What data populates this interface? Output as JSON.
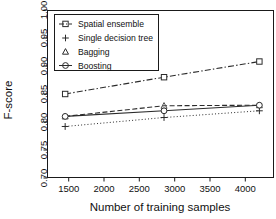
{
  "chart_data": {
    "type": "line",
    "title": "",
    "xlabel": "Number of training samples",
    "ylabel": "F-score",
    "xlim": [
      1200,
      4400
    ],
    "ylim": [
      0.7,
      1.0
    ],
    "xticks": [
      1500,
      2000,
      2500,
      3000,
      3500,
      4000
    ],
    "xtick_labels": [
      "1500",
      "2000",
      "2500",
      "3000",
      "3500",
      "4000"
    ],
    "yticks": [
      0.7,
      0.75,
      0.8,
      0.85,
      0.9,
      0.95,
      1.0
    ],
    "ytick_labels": [
      "0.70",
      "0.75",
      "0.80",
      "0.85",
      "0.90",
      "0.95",
      "1.00"
    ],
    "grid": false,
    "legend_position": "upper left",
    "x": [
      1450,
      2850,
      4200
    ],
    "series": [
      {
        "name": "Spatial ensemble",
        "marker": "square",
        "linestyle": "dashdot",
        "color": "#2b2b2b",
        "values": [
          0.85,
          0.88,
          0.908
        ]
      },
      {
        "name": "Single decision tree",
        "marker": "plus",
        "linestyle": "dotted",
        "color": "#2b2b2b",
        "values": [
          0.792,
          0.808,
          0.82
        ]
      },
      {
        "name": "Bagging",
        "marker": "triangle",
        "linestyle": "dashed",
        "color": "#555555",
        "values": [
          0.81,
          0.829,
          0.83
        ]
      },
      {
        "name": "Boosting",
        "marker": "circle",
        "linestyle": "solid",
        "color": "#2b2b2b",
        "values": [
          0.81,
          0.82,
          0.83
        ]
      }
    ]
  },
  "axes": {
    "x_title": "Number of training samples",
    "y_title": "F-score",
    "x_tick_0": "1500",
    "x_tick_1": "2000",
    "x_tick_2": "2500",
    "x_tick_3": "3000",
    "x_tick_4": "3500",
    "x_tick_5": "4000",
    "y_tick_0": "0.70",
    "y_tick_1": "0.75",
    "y_tick_2": "0.80",
    "y_tick_3": "0.85",
    "y_tick_4": "0.90",
    "y_tick_5": "0.95",
    "y_tick_6": "1.00"
  },
  "legend": {
    "items": [
      {
        "label": "Spatial ensemble",
        "marker": "square-marker-icon"
      },
      {
        "label": "Single decision tree",
        "marker": "plus-marker-icon"
      },
      {
        "label": "Bagging",
        "marker": "triangle-marker-icon"
      },
      {
        "label": "Boosting",
        "marker": "circle-marker-icon"
      }
    ]
  }
}
